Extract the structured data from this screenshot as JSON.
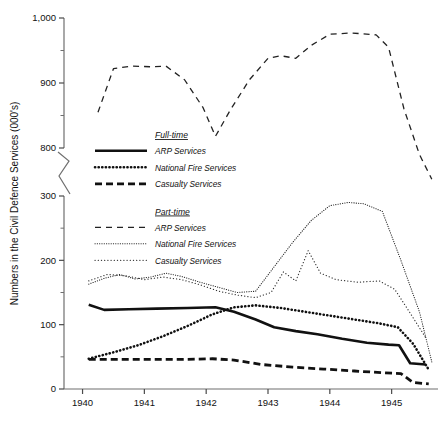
{
  "chart_data": {
    "type": "line",
    "title": "",
    "xlabel": "",
    "ylabel": "Numbers in the Civil Defence Services (000's)",
    "xlim": [
      1939.7,
      1945.75
    ],
    "ylim": [
      0,
      1000
    ],
    "y_axis_break": {
      "below": 300,
      "above": 800
    },
    "grid": false,
    "legend_position": "inside-left",
    "x_ticks": [
      "1940",
      "1941",
      "1942",
      "1943",
      "1944",
      "1945"
    ],
    "x_tick_values": [
      1940,
      1941,
      1942,
      1943,
      1944,
      1945
    ],
    "y_ticks": [
      "0",
      "100",
      "200",
      "300",
      "800",
      "900",
      "1,000"
    ],
    "y_tick_values": [
      0,
      100,
      200,
      300,
      800,
      900,
      1000
    ],
    "y_minor_ticks": [
      50,
      150,
      250,
      850,
      950
    ],
    "legend_groups": [
      {
        "heading": "Full-time",
        "entries": [
          {
            "label": "ARP Services",
            "style": "solid-thick"
          },
          {
            "label": "National Fire Services",
            "style": "dotted-thick"
          },
          {
            "label": "Casualty Services",
            "style": "dashed-thick"
          }
        ]
      },
      {
        "heading": "Part-time",
        "entries": [
          {
            "label": "ARP Services",
            "style": "dashed-thin"
          },
          {
            "label": "National Fire Services",
            "style": "dotted-fine"
          },
          {
            "label": "Casualty Services",
            "style": "dotted-sparse"
          }
        ]
      }
    ],
    "series": [
      {
        "name": "ARP Services",
        "group": "Full-time",
        "style": "solid-thick",
        "x": [
          1940.1,
          1940.35,
          1940.75,
          1941.2,
          1941.7,
          1942.15,
          1942.45,
          1942.8,
          1943.1,
          1943.45,
          1943.8,
          1944.2,
          1944.6,
          1944.95,
          1945.12,
          1945.3,
          1945.55
        ],
        "values": [
          131,
          123,
          124,
          125,
          126,
          127,
          120,
          108,
          96,
          90,
          85,
          78,
          72,
          69,
          68,
          40,
          38
        ]
      },
      {
        "name": "National Fire Services",
        "group": "Full-time",
        "style": "dotted-thick",
        "x": [
          1940.1,
          1940.5,
          1940.9,
          1941.3,
          1941.7,
          1942.1,
          1942.45,
          1942.8,
          1943.2,
          1943.6,
          1944.0,
          1944.4,
          1944.8,
          1945.1,
          1945.35,
          1945.6
        ],
        "values": [
          47,
          57,
          68,
          82,
          98,
          116,
          127,
          130,
          126,
          120,
          114,
          108,
          102,
          96,
          70,
          30
        ]
      },
      {
        "name": "Casualty Services",
        "group": "Full-time",
        "style": "dashed-thick",
        "x": [
          1940.1,
          1940.6,
          1941.1,
          1941.6,
          1942.1,
          1942.45,
          1942.9,
          1943.4,
          1943.9,
          1944.4,
          1944.9,
          1945.15,
          1945.35,
          1945.6
        ],
        "values": [
          46,
          46,
          46,
          46,
          47,
          45,
          38,
          34,
          31,
          28,
          25,
          24,
          10,
          8
        ]
      },
      {
        "name": "ARP Services",
        "group": "Part-time",
        "style": "dashed-thin",
        "x": [
          1940.25,
          1940.5,
          1940.8,
          1941.1,
          1941.35,
          1941.65,
          1941.95,
          1942.15,
          1942.4,
          1942.7,
          1943.0,
          1943.2,
          1943.45,
          1943.7,
          1944.0,
          1944.35,
          1944.75,
          1944.95,
          1945.2,
          1945.45,
          1945.65
        ],
        "values": [
          855,
          922,
          926,
          925,
          926,
          905,
          862,
          818,
          860,
          905,
          938,
          942,
          938,
          958,
          975,
          977,
          974,
          955,
          860,
          790,
          752
        ]
      },
      {
        "name": "National Fire Services",
        "group": "Part-time",
        "style": "dotted-fine",
        "x": [
          1940.1,
          1940.35,
          1940.6,
          1940.85,
          1941.1,
          1941.35,
          1941.6,
          1941.9,
          1942.2,
          1942.5,
          1942.8,
          1943.1,
          1943.4,
          1943.7,
          1944.0,
          1944.3,
          1944.55,
          1944.85,
          1945.15,
          1945.45,
          1945.65
        ],
        "values": [
          163,
          172,
          178,
          171,
          174,
          180,
          175,
          166,
          158,
          150,
          152,
          190,
          228,
          262,
          285,
          290,
          288,
          276,
          200,
          120,
          42
        ]
      },
      {
        "name": "Casualty Services",
        "group": "Part-time",
        "style": "dotted-sparse",
        "x": [
          1940.1,
          1940.4,
          1940.7,
          1941.0,
          1941.3,
          1941.6,
          1941.9,
          1942.2,
          1942.5,
          1942.8,
          1943.05,
          1943.25,
          1943.45,
          1943.65,
          1943.85,
          1944.1,
          1944.45,
          1944.8,
          1945.05,
          1945.3,
          1945.55
        ],
        "values": [
          168,
          178,
          176,
          170,
          174,
          170,
          162,
          152,
          146,
          142,
          150,
          182,
          168,
          215,
          180,
          170,
          166,
          168,
          155,
          118,
          80
        ]
      }
    ]
  },
  "caption": ""
}
